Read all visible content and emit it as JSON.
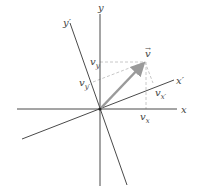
{
  "diagram": {
    "type": "rotated-coordinate-vector-components",
    "colors": {
      "axis": "#4a4a4a",
      "vector": "#9a9a9a",
      "dashed": "#c8c8c8",
      "label": "#444444"
    },
    "labels": {
      "x_axis": "x",
      "y_axis": "y",
      "x_prime_axis": "x′",
      "y_prime_axis": "y′",
      "vector": "v",
      "vector_arrow": "→",
      "v_x_base": "v",
      "v_x_sub": "x",
      "v_y_base": "v",
      "v_y_sub": "y",
      "v_xp_base": "v",
      "v_xp_sub": "x′",
      "v_yp_base": "v",
      "v_yp_sub": "y′"
    }
  }
}
